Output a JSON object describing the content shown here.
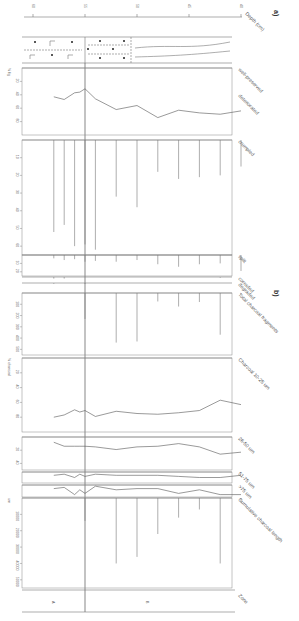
{
  "figure": {
    "panel_a_label": "a)",
    "panel_b_label": "b)",
    "depth_axis": {
      "label": "Depth (cm)",
      "ticks": [
        "60",
        "55",
        "50",
        "45",
        "40"
      ]
    },
    "zone_label": "Zone",
    "zones": [
      "A",
      "B"
    ]
  },
  "chart_data": [
    {
      "type": "line",
      "title": "well-preserved / deteriorated",
      "ylabel": "% fig",
      "ticks": [
        "20",
        "40",
        "60",
        "80"
      ],
      "ylim": [
        0,
        100
      ],
      "x": [
        58,
        57,
        56,
        55.5,
        55,
        54,
        52,
        50,
        48,
        46,
        44,
        42,
        40
      ],
      "values": [
        43,
        47,
        37,
        36,
        31,
        46,
        62,
        56,
        74,
        63,
        67,
        69,
        64
      ]
    },
    {
      "type": "bar",
      "title": "crumpled",
      "ticks": [
        "10",
        "20",
        "30",
        "40",
        "50",
        "60"
      ],
      "x": [
        58,
        57,
        56,
        55,
        54,
        52,
        50,
        48,
        46,
        44,
        42,
        40
      ],
      "values": [
        52,
        48,
        60,
        59,
        62,
        32,
        38,
        18,
        22,
        21,
        20,
        15
      ]
    },
    {
      "type": "bar",
      "title": "split",
      "ticks": [
        "10",
        "20"
      ],
      "x": [
        58,
        57,
        56,
        55,
        54,
        52,
        50,
        48,
        46,
        44,
        42,
        40
      ],
      "values": [
        4,
        6,
        5,
        8,
        7,
        8,
        6,
        11,
        14,
        11,
        10,
        19
      ]
    },
    {
      "type": "bar",
      "title": "corroded",
      "x": [
        58,
        57,
        42
      ],
      "values": [
        2,
        2,
        1
      ]
    },
    {
      "type": "bar",
      "title": "degraded",
      "x": [
        58,
        55,
        40
      ],
      "values": [
        1,
        1,
        1
      ]
    },
    {
      "type": "bar",
      "title": "Total charcoal fragments",
      "ticks": [
        "100",
        "200",
        "300",
        "400",
        "500"
      ],
      "x": [
        55,
        52,
        50,
        48,
        46,
        44,
        42,
        40
      ],
      "values": [
        230,
        440,
        430,
        75,
        120,
        80,
        370,
        10
      ]
    },
    {
      "type": "line",
      "title": "Charcoal 10-25 um",
      "ylabel": "% charcoal",
      "ticks": [
        "20",
        "40",
        "60",
        "80"
      ],
      "x": [
        58,
        57,
        56,
        55.5,
        55,
        54,
        52,
        50,
        48,
        46,
        44,
        42,
        40
      ],
      "values": [
        80,
        77,
        70,
        73,
        71,
        79,
        72,
        75,
        76,
        74,
        71,
        57,
        63
      ]
    },
    {
      "type": "line",
      "title": "26-50 um",
      "ticks": [
        "20",
        "40"
      ],
      "x": [
        58,
        57,
        56,
        55.5,
        55,
        54,
        52,
        50,
        48,
        46,
        44,
        42,
        40
      ],
      "values": [
        8,
        14,
        14,
        14,
        14,
        15,
        19,
        15,
        14,
        10,
        15,
        26,
        23
      ]
    },
    {
      "type": "line",
      "title": "51-75 um",
      "x": [
        58,
        57,
        56,
        55.5,
        55,
        54,
        52,
        50,
        48,
        46,
        44,
        42,
        40
      ],
      "values": [
        3,
        2,
        5,
        2,
        4,
        2,
        3,
        3,
        3,
        4,
        5,
        5,
        3
      ]
    },
    {
      "type": "line",
      "title": ">75 um",
      "x": [
        58,
        57,
        56,
        55.5,
        55,
        54,
        52,
        50,
        48,
        46,
        44,
        42,
        40
      ],
      "values": [
        3,
        2,
        8,
        4,
        7,
        1,
        4,
        3,
        3,
        7,
        4,
        8,
        8
      ]
    },
    {
      "type": "bar",
      "title": "Cumulative charcoal length",
      "ylabel": "um",
      "ticks": [
        "10000",
        "20000",
        "30000",
        "40000",
        "50000"
      ],
      "x": [
        55,
        52,
        50,
        48,
        46,
        44,
        42,
        40
      ],
      "values": [
        14000,
        40000,
        36000,
        22000,
        12000,
        7000,
        40000,
        3000
      ]
    }
  ]
}
